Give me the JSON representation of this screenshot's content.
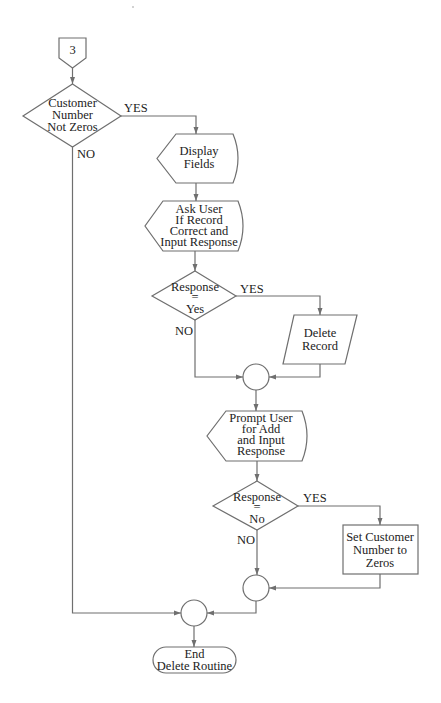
{
  "diagram": {
    "type": "flowchart",
    "title": "Delete Routine",
    "nodes": {
      "connector": {
        "label": "3",
        "kind": "off-page-connector"
      },
      "decision1": {
        "lines": [
          "Customer",
          "Number",
          "Not Zeros"
        ],
        "kind": "decision"
      },
      "display": {
        "lines": [
          "Display",
          "Fields"
        ],
        "kind": "display"
      },
      "ask": {
        "lines": [
          "Ask User",
          "If Record",
          "Correct and",
          "Input Response"
        ],
        "kind": "display"
      },
      "decision2": {
        "lines": [
          "Response",
          "=",
          "Yes"
        ],
        "kind": "decision"
      },
      "delete": {
        "lines": [
          "Delete",
          "Record"
        ],
        "kind": "input-output"
      },
      "join1": {
        "kind": "connector"
      },
      "prompt": {
        "lines": [
          "Prompt User",
          "for Add",
          "and Input",
          "Response"
        ],
        "kind": "display"
      },
      "decision3": {
        "lines": [
          "Response",
          "=",
          "No"
        ],
        "kind": "decision"
      },
      "setzero": {
        "lines": [
          "Set Customer",
          "Number to",
          "Zeros"
        ],
        "kind": "process"
      },
      "join2": {
        "kind": "connector"
      },
      "join3": {
        "kind": "connector"
      },
      "end": {
        "lines": [
          "End",
          "Delete Routine"
        ],
        "kind": "terminator"
      }
    },
    "edge_labels": {
      "d1_yes": "YES",
      "d1_no": "NO",
      "d2_yes": "YES",
      "d2_no": "NO",
      "d3_yes": "YES",
      "d3_no": "NO"
    },
    "colors": {
      "stroke": "#6f6f6f",
      "text": "#222222",
      "background": "#ffffff"
    }
  }
}
